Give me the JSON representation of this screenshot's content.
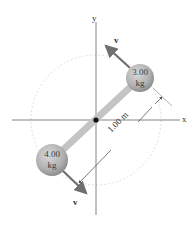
{
  "diagram": {
    "axes": {
      "x_label": "x",
      "y_label": "y"
    },
    "masses": [
      {
        "id": "upper",
        "mass_value": "3.00",
        "unit": "kg"
      },
      {
        "id": "lower",
        "mass_value": "4.00",
        "unit": "kg"
      }
    ],
    "velocity_labels": {
      "upper": "v⃗",
      "lower": "v⃗"
    },
    "dimension": {
      "label": "1.00 m"
    },
    "colors": {
      "rod": "#c8c8c8",
      "sphere": "#b5b5b5",
      "arrow": "#6f6f6f",
      "axis": "#555555",
      "dashed_circle": "#d0d0d0",
      "background": "#ffffff"
    }
  }
}
